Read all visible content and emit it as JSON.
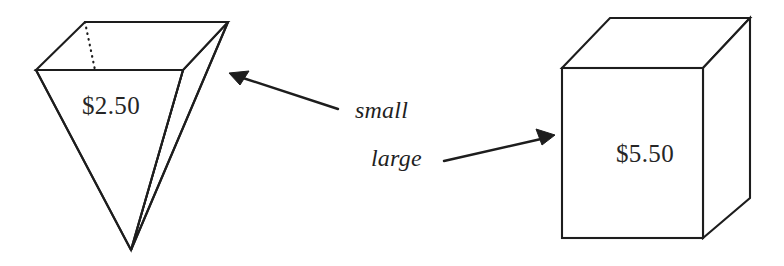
{
  "figure": {
    "name": "container-size-price-comparison",
    "background_color": "#ffffff",
    "stroke_color": "#1d1d1d",
    "text_color": "#262626"
  },
  "shapes": {
    "small": {
      "label": "small",
      "price": "$2.50",
      "form": "inverted-square-pyramid",
      "price_anchor_x": 111,
      "price_anchor_y": 114
    },
    "large": {
      "label": "large",
      "price": "$5.50",
      "form": "cube-box",
      "price_anchor_x": 645,
      "price_anchor_y": 162
    }
  },
  "annotations": [
    {
      "text": "small",
      "x": 355,
      "y": 118,
      "points_to": "small",
      "arrow_direction": "up-left"
    },
    {
      "text": "large",
      "x": 371,
      "y": 166,
      "points_to": "large",
      "arrow_direction": "up-right"
    }
  ]
}
